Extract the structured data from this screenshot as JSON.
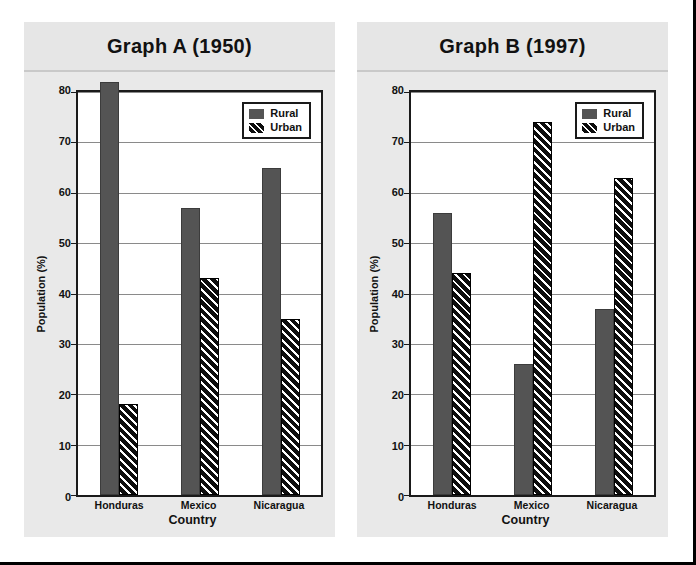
{
  "chart_data": [
    {
      "type": "bar",
      "title": "Graph A (1950)",
      "xlabel": "Country",
      "ylabel": "Population (%)",
      "ylim": [
        0,
        80
      ],
      "ytick_step": 10,
      "yticks": [
        0,
        10,
        20,
        30,
        40,
        50,
        60,
        70,
        80
      ],
      "grid": true,
      "legend_position": "top-right",
      "categories": [
        "Honduras",
        "Mexico",
        "Nicaragua"
      ],
      "series": [
        {
          "name": "Rural",
          "values": [
            82,
            57,
            65
          ],
          "color": "#545454",
          "fill": "solid"
        },
        {
          "name": "Urban",
          "values": [
            18,
            43,
            35
          ],
          "color": "#0d0d0d",
          "fill": "diagonal-hatch"
        }
      ]
    },
    {
      "type": "bar",
      "title": "Graph B (1997)",
      "xlabel": "Country",
      "ylabel": "Population (%)",
      "ylim": [
        0,
        80
      ],
      "ytick_step": 10,
      "yticks": [
        0,
        10,
        20,
        30,
        40,
        50,
        60,
        70,
        80
      ],
      "grid": true,
      "legend_position": "top-right",
      "categories": [
        "Honduras",
        "Mexico",
        "Nicaragua"
      ],
      "series": [
        {
          "name": "Rural",
          "values": [
            56,
            26,
            37
          ],
          "color": "#545454",
          "fill": "solid"
        },
        {
          "name": "Urban",
          "values": [
            44,
            74,
            63
          ],
          "color": "#0d0d0d",
          "fill": "diagonal-hatch"
        }
      ]
    }
  ],
  "figure": {
    "panel_background": "#e9e9e9",
    "plot_background": "#ffffff",
    "axis_color": "#1a1a1a",
    "grid_color": "#8a8a8a",
    "frame_color": "#000000"
  }
}
